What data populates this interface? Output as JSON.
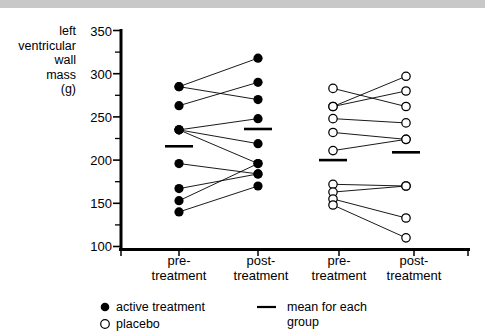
{
  "chart_data": {
    "type": "line",
    "title": "",
    "xlabel": "",
    "ylabel": "left\nventricular\nwall\nmass\n(g)",
    "ylim": [
      100,
      350
    ],
    "ytick_labels": [
      "350",
      "300",
      "250",
      "200",
      "150",
      "100"
    ],
    "ytick_values": [
      350,
      300,
      250,
      200,
      150,
      100
    ],
    "yminor_values": [
      325,
      275,
      225,
      175,
      125
    ],
    "grid": false,
    "legend_position": "bottom-left",
    "categories": [
      "pre-\ntreatment",
      "post-\ntreatment",
      "pre-\ntreatment",
      "post-\ntreatment"
    ],
    "groups": [
      {
        "name": "active treatment",
        "marker": "filled-circle",
        "color": "#000000",
        "x_positions": [
          "pre-treatment",
          "post-treatment"
        ],
        "pairs": [
          {
            "pre": 285,
            "post": 318
          },
          {
            "pre": 263,
            "post": 290
          },
          {
            "pre": 285,
            "post": 270
          },
          {
            "pre": 235,
            "post": 248
          },
          {
            "pre": 235,
            "post": 219
          },
          {
            "pre": 235,
            "post": 196
          },
          {
            "pre": 196,
            "post": 184
          },
          {
            "pre": 167,
            "post": 184
          },
          {
            "pre": 153,
            "post": 196
          },
          {
            "pre": 140,
            "post": 170
          }
        ],
        "mean_pre": 216,
        "mean_post": 236
      },
      {
        "name": "placebo",
        "marker": "open-circle",
        "color": "#000000",
        "x_positions": [
          "pre-treatment",
          "post-treatment"
        ],
        "pairs": [
          {
            "pre": 283,
            "post": 262
          },
          {
            "pre": 262,
            "post": 297
          },
          {
            "pre": 262,
            "post": 280
          },
          {
            "pre": 248,
            "post": 243
          },
          {
            "pre": 232,
            "post": 224
          },
          {
            "pre": 211,
            "post": 224
          },
          {
            "pre": 172,
            "post": 170
          },
          {
            "pre": 163,
            "post": 170
          },
          {
            "pre": 155,
            "post": 133
          },
          {
            "pre": 148,
            "post": 110
          }
        ],
        "mean_pre": 200,
        "mean_post": 209
      }
    ]
  },
  "legend": {
    "active_label": "active treatment",
    "placebo_label": "placebo",
    "mean_label": "mean for each\ngroup"
  }
}
